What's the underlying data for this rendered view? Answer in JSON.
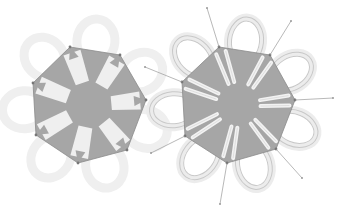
{
  "figure": {
    "colors": {
      "background": "#ffffff",
      "fill": "#a6a6a6",
      "finger": "#efefef",
      "petal_left": "#efefef",
      "petal_right_stroke": "#c8c8c8",
      "edge": "#8a8a8a",
      "ray": "#9a9a9a"
    },
    "left_heptagon": {
      "center": [
        90,
        105
      ],
      "vertices": [
        [
          70,
          47
        ],
        [
          120,
          55
        ],
        [
          146,
          100
        ],
        [
          127,
          150
        ],
        [
          78,
          163
        ],
        [
          36,
          135
        ],
        [
          33,
          83
        ]
      ]
    },
    "right_heptagon": {
      "center": [
        239,
        105
      ],
      "vertices": [
        [
          219,
          47
        ],
        [
          270,
          55
        ],
        [
          295,
          100
        ],
        [
          276,
          149
        ],
        [
          227,
          163
        ],
        [
          185,
          136
        ],
        [
          182,
          82
        ]
      ],
      "rays": [
        [
          [
            219,
            47
          ],
          [
            207,
            8
          ]
        ],
        [
          [
            270,
            55
          ],
          [
            291,
            21
          ]
        ],
        [
          [
            295,
            100
          ],
          [
            333,
            98
          ]
        ],
        [
          [
            276,
            149
          ],
          [
            302,
            178
          ]
        ],
        [
          [
            227,
            163
          ],
          [
            220,
            204
          ]
        ],
        [
          [
            185,
            136
          ],
          [
            151,
            153
          ]
        ],
        [
          [
            182,
            82
          ],
          [
            145,
            67
          ]
        ]
      ]
    }
  }
}
